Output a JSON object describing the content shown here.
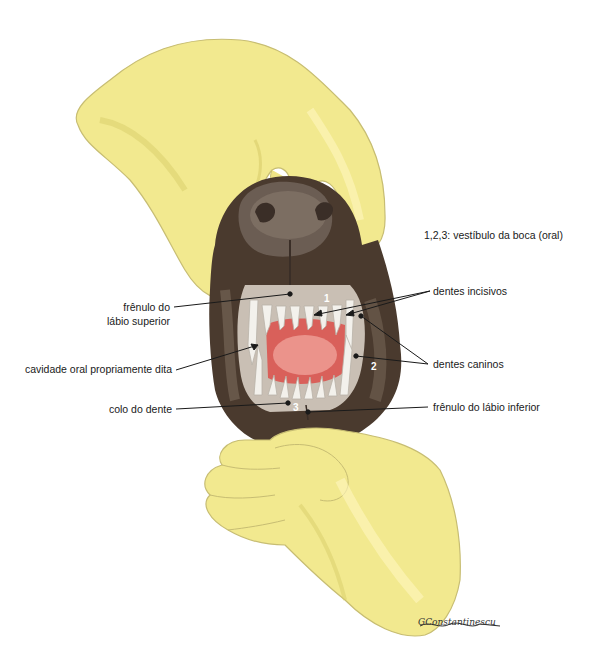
{
  "figure": {
    "legend": "1,2,3: vestíbulo da boca (oral)",
    "signature": "GConstantinescu",
    "colors": {
      "glove": "#f2e98f",
      "glove_shadow": "#d8cd6a",
      "glove_outline": "#b8b070",
      "muzzle": "#4a3a2e",
      "muzzle_light": "#7c6b5c",
      "nose": "#5a4d45",
      "tongue": "#d9605a",
      "tongue_light": "#f0a49c",
      "teeth": "#f3f1ec",
      "gum": "#c9bfb4",
      "leader_line": "#1a1a1a"
    },
    "numbers": [
      {
        "id": "1",
        "text": "1"
      },
      {
        "id": "2",
        "text": "2"
      },
      {
        "id": "3",
        "text": "3"
      }
    ],
    "labels": {
      "frenulo_superior_l1": "frênulo do",
      "frenulo_superior_l2": "lábio superior",
      "cavidade_oral": "cavidade oral propriamente dita",
      "colo_dente": "colo do dente",
      "dentes_incisivos": "dentes incisivos",
      "dentes_caninos": "dentes caninos",
      "frenulo_inferior": "frênulo do lábio inferior"
    }
  }
}
